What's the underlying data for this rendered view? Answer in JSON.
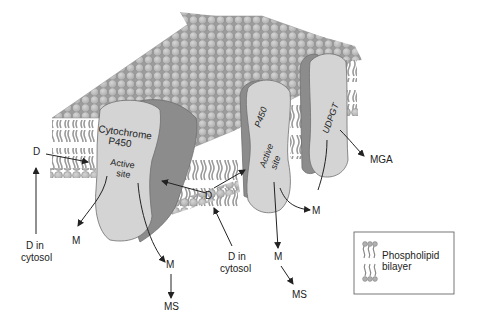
{
  "diagram": {
    "type": "membrane-enzyme-illustration",
    "colors": {
      "background": "#ffffff",
      "lipid_head": "#b4b4b4",
      "lipid_head_stroke": "#8a8a8a",
      "lipid_tail": "#9a9a9a",
      "enzyme_light": "#d4d4d4",
      "enzyme_dark": "#8c8c8c",
      "enzyme_stroke": "#6e6e6e",
      "text": "#222222",
      "arrow": "#222222"
    },
    "enzymes": [
      {
        "id": "cyp450_left",
        "label_line1": "Cytochrome",
        "label_line2": "P450",
        "site_line1": "Active",
        "site_line2": "site"
      },
      {
        "id": "cyp450_right",
        "label": "P450",
        "site_line1": "Active",
        "site_line2": "site"
      },
      {
        "id": "udpgt",
        "label": "UDPGT"
      }
    ],
    "labels": {
      "d_left": "D",
      "d_center": "D",
      "d_cytosol_left_line1": "D in",
      "d_cytosol_left_line2": "cytosol",
      "d_cytosol_center_line1": "D in",
      "d_cytosol_center_line2": "cytosol",
      "m_left": "M",
      "m_center": "M",
      "m_right_p450": "M",
      "m_right_lower": "M",
      "ms_left": "MS",
      "ms_right": "MS",
      "mga": "MGA"
    },
    "legend": {
      "line1": "Phospholipid",
      "line2": "bilayer"
    }
  }
}
